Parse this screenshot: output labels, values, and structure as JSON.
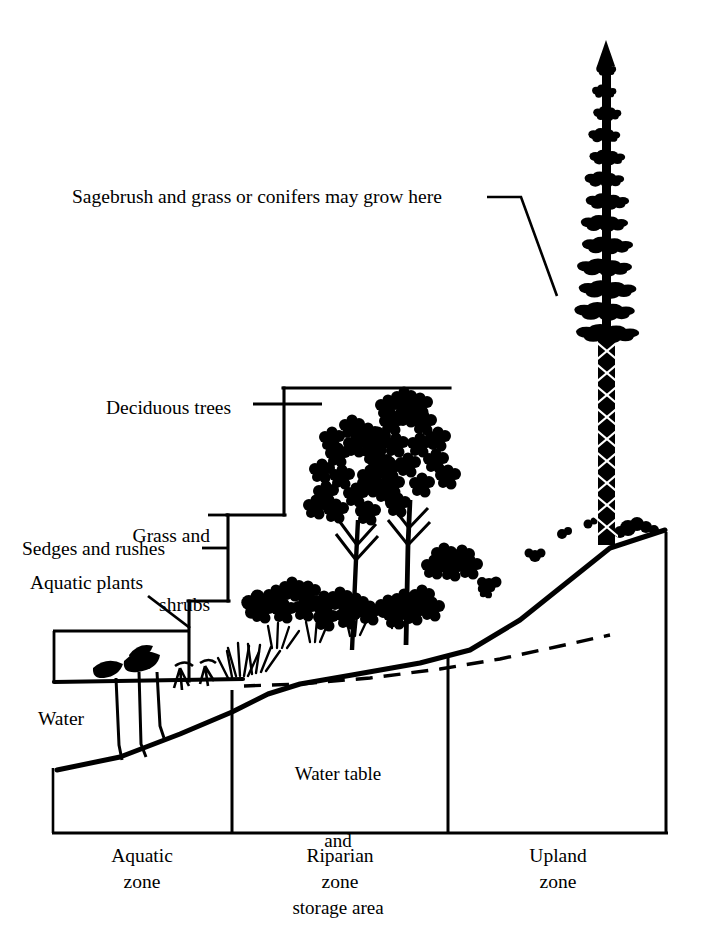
{
  "figure": {
    "ink_color": "#000000",
    "background_color": "#ffffff"
  },
  "callouts": {
    "sagebrush": "Sagebrush and grass or conifers may grow here",
    "deciduous_trees": "Deciduous trees",
    "grass_and_shrubs_line1": "Grass and",
    "grass_and_shrubs_line2": "shrubs",
    "sedges_and_rushes": "Sedges and rushes",
    "aquatic_plants": "Aquatic plants",
    "water": "Water"
  },
  "interior": {
    "water_table_line1": "Water table",
    "water_table_line2": "and",
    "water_table_line3": "storage area"
  },
  "zones": [
    {
      "name_line1": "Aquatic",
      "name_line2": "zone"
    },
    {
      "name_line1": "Riparian",
      "name_line2": "zone"
    },
    {
      "name_line1": "Upland",
      "name_line2": "zone"
    }
  ]
}
